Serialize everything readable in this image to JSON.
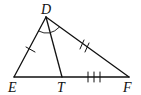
{
  "diagram": {
    "type": "triangle-with-angle-bisector",
    "points": {
      "D": {
        "label": "D",
        "x": 46,
        "y": 17
      },
      "E": {
        "label": "E",
        "x": 14,
        "y": 77
      },
      "T": {
        "label": "T",
        "x": 62,
        "y": 77
      },
      "F": {
        "label": "F",
        "x": 129,
        "y": 77
      }
    },
    "segments": [
      "DE",
      "DF",
      "EF",
      "DT"
    ],
    "markings": {
      "DE": "single tick",
      "DF": "double tick",
      "TF": "triple tick",
      "angle_EDF": "bisected by DT (arc)"
    },
    "stroke_color": "#111111",
    "background": "#ffffff"
  }
}
